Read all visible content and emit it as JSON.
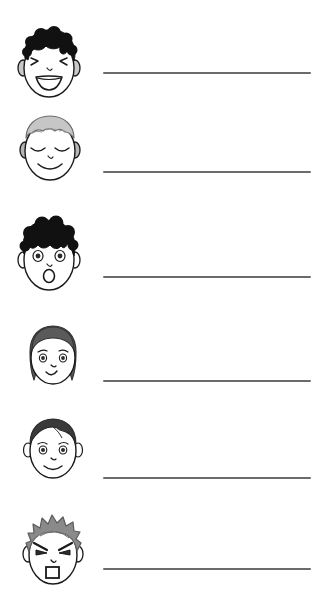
{
  "document": {
    "type": "emotion-vocabulary-worksheet",
    "title": "",
    "background_color": "#ffffff",
    "width": 329,
    "height": 614
  },
  "palette": {
    "outline": "#1a1a1a",
    "skin": "#ffffff",
    "line": "#6b6b6b",
    "hair_black": "#111111",
    "hair_light_grey": "#c6c6c6",
    "hair_mid_grey": "#8a8a8a",
    "hair_dark_grey": "#5a5a5a",
    "hair_near_black": "#3a3a3a",
    "ear_fill": "#c9c9c9",
    "eye_dark": "#2b2b2b",
    "mouth_dark": "#1a1a1a"
  },
  "rows": [
    {
      "index": 1,
      "face": {
        "name": "laughing-face",
        "expression": "happy-laughing",
        "hair_style": "curly",
        "hair_color": "#111111",
        "eyes": "squinted-closed",
        "mouth": "open-laugh",
        "x": 16,
        "y": 26,
        "width": 66,
        "height": 74
      },
      "line": {
        "x": 103,
        "y": 72,
        "width": 208
      }
    },
    {
      "index": 2,
      "face": {
        "name": "content-face",
        "expression": "calm-content",
        "hair_style": "wavy-short",
        "hair_color": "#c6c6c6",
        "eyes": "closed-arcs",
        "mouth": "gentle-smile",
        "x": 18,
        "y": 110,
        "width": 64,
        "height": 74
      },
      "line": {
        "x": 103,
        "y": 171,
        "width": 208
      }
    },
    {
      "index": 3,
      "face": {
        "name": "surprised-face",
        "expression": "surprised",
        "hair_style": "curly-bouffant",
        "hair_color": "#111111",
        "eyes": "wide-open",
        "mouth": "round-o",
        "x": 16,
        "y": 216,
        "width": 66,
        "height": 78
      },
      "line": {
        "x": 103,
        "y": 276,
        "width": 208
      }
    },
    {
      "index": 4,
      "face": {
        "name": "worried-face",
        "expression": "worried-uncertain",
        "hair_style": "long-framing",
        "hair_color": "#5a5a5a",
        "eyes": "open-with-brows",
        "mouth": "slight-curve",
        "x": 22,
        "y": 322,
        "width": 62,
        "height": 68
      },
      "line": {
        "x": 103,
        "y": 380,
        "width": 208
      }
    },
    {
      "index": 5,
      "face": {
        "name": "smiling-face",
        "expression": "happy-smiling",
        "hair_style": "short-parted",
        "hair_color": "#3a3a3a",
        "eyes": "open-with-brows",
        "mouth": "small-smile",
        "x": 22,
        "y": 414,
        "width": 62,
        "height": 68
      },
      "line": {
        "x": 103,
        "y": 477,
        "width": 208
      }
    },
    {
      "index": 6,
      "face": {
        "name": "angry-face",
        "expression": "angry",
        "hair_style": "spiky",
        "hair_color": "#8a8a8a",
        "eyes": "angry-slanted",
        "mouth": "square-open-frown",
        "x": 20,
        "y": 510,
        "width": 66,
        "height": 80
      },
      "line": {
        "x": 103,
        "y": 568,
        "width": 208
      }
    }
  ]
}
